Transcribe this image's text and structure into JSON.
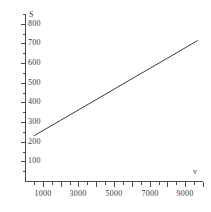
{
  "chart_data": {
    "type": "line",
    "title": "",
    "subtitle": "",
    "xlabel": "v",
    "ylabel": "S",
    "xlim": [
      0,
      10000
    ],
    "ylim": [
      0,
      850
    ],
    "grid": false,
    "legend": null,
    "x_ticks": [
      1000,
      3000,
      5000,
      7000,
      9000
    ],
    "x_tick_labels": [
      "1000",
      "3000",
      "5000",
      "7000",
      "9000"
    ],
    "x_major_step": 1000,
    "x_minor_step": 500,
    "y_ticks": [
      100,
      200,
      300,
      400,
      500,
      600,
      700,
      800
    ],
    "y_tick_labels": [
      "100",
      "200",
      "300",
      "400",
      "500",
      "600",
      "700",
      "800"
    ],
    "y_major_step": 100,
    "line_color": "#3b3b3b",
    "series": [
      {
        "name": "S(v)",
        "x": [
          500,
          2000,
          4000,
          6000,
          8000,
          9700
        ],
        "y": [
          230,
          309,
          414,
          520,
          625,
          715
        ]
      }
    ],
    "annotations": []
  },
  "axes": {
    "y_title": "S",
    "x_title": "v"
  },
  "colors": {
    "background": "#ffffff",
    "axis": "#4a4a4a",
    "text": "#3a3a3a",
    "line": "#3b3b3b"
  }
}
